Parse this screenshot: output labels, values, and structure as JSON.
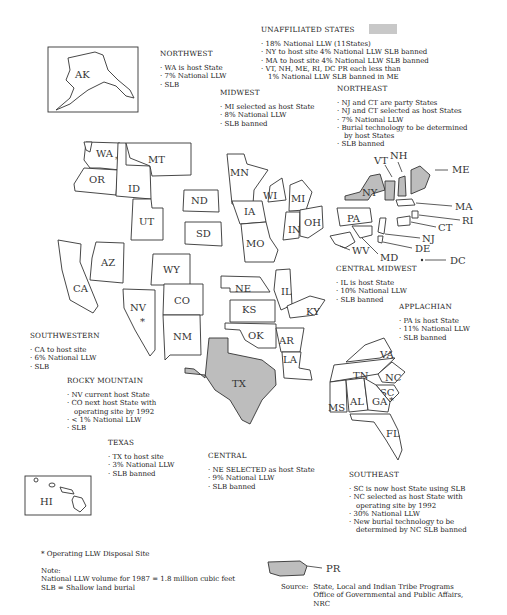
{
  "map": {
    "states": [
      "WA",
      "OR",
      "ID",
      "MT",
      "UT",
      "ND",
      "SD",
      "WY",
      "CO",
      "NM",
      "AZ",
      "CA",
      "NV",
      "MN",
      "IA",
      "MO",
      "WI",
      "MI",
      "IN",
      "OH",
      "IL",
      "KY",
      "NE",
      "KS",
      "OK",
      "AR",
      "LA",
      "TX",
      "TN",
      "NC",
      "SC",
      "VA",
      "MS",
      "AL",
      "GA",
      "FL",
      "PA",
      "NY",
      "VT",
      "NH",
      "ME",
      "MA",
      "RI",
      "CT",
      "NJ",
      "DE",
      "MD",
      "WV",
      "DC",
      "AK",
      "HI",
      "PR"
    ],
    "shaded_states": [
      "TX",
      "NY",
      "VT",
      "NH",
      "ME",
      "PR"
    ],
    "operating_site_marker": "*",
    "shade_color": "#bdbdbd"
  },
  "regions": {
    "unaffiliated": {
      "title": "UNAFFILIATED STATES",
      "items": [
        "18% National LLW (11States)",
        "NY to host site    4% National LLW    SLB banned",
        "MA to host site    4% National LLW    SLB banned",
        "VT, NH, ME, RI, DC   PR each less than"
      ],
      "continuation": "1% National LLW    SLB banned in ME"
    },
    "northwest": {
      "title": "NORTHWEST",
      "items": [
        "WA is host State",
        "7% National LLW",
        "SLB"
      ]
    },
    "midwest": {
      "title": "MIDWEST",
      "items": [
        "MI selected as host State",
        "8% National LLW",
        "SLB banned"
      ]
    },
    "northeast": {
      "title": "NORTHEAST",
      "items": [
        "NJ and CT are party States",
        "NJ and CT selected as host States",
        "7% National LLW",
        "Burial technology to be determined"
      ],
      "continuation": "by host States",
      "last": "SLB banned"
    },
    "central_midwest": {
      "title": "CENTRAL MIDWEST",
      "items": [
        "IL is host State",
        "10% National LLW",
        "SLB banned"
      ]
    },
    "applachian": {
      "title": "APPLACHIAN",
      "items": [
        "PA is host State",
        "11% National LLW",
        "SLB banned"
      ]
    },
    "southwestern": {
      "title": "SOUTHWESTERN",
      "items": [
        "CA to host site",
        "6% National LLW",
        "SLB"
      ]
    },
    "rocky_mountain": {
      "title": "ROCKY MOUNTAIN",
      "items": [
        "NV current  host State",
        "CO next host State with"
      ],
      "continuation": "operating site by 1992",
      "rest": [
        "< 1% National LLW",
        "SLB"
      ]
    },
    "texas": {
      "title": "TEXAS",
      "items": [
        "TX to host site",
        "3% National LLW",
        "SLB banned"
      ]
    },
    "central": {
      "title": "CENTRAL",
      "items": [
        "NE SELECTED as host State",
        "9% National LLW",
        "SLB banned"
      ]
    },
    "southeast": {
      "title": "SOUTHEAST",
      "items": [
        "SC is now host State using SLB",
        "NC  selected as host State with"
      ],
      "continuation": "operating site by 1992",
      "mid": [
        "30% National LLW",
        "New burial technology to be"
      ],
      "continuation2": "determined by NC   SLB banned"
    }
  },
  "legend": {
    "operating_site": "*  Operating LLW Disposal Site",
    "note_title": "Note:",
    "note_volume": "National LLW volume for 1987  =  1.8 million cubic feet",
    "note_slb": "SLB  =  Shallow land burial"
  },
  "source": {
    "label": "Source:",
    "line1": "State, Local and Indian Tribe Programs",
    "line2": "Office of Governmental and Public Affairs,",
    "line3": "NRC"
  }
}
